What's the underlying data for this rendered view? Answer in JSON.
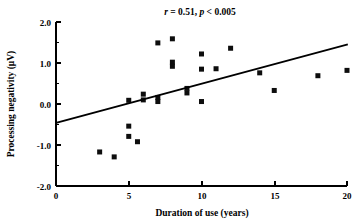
{
  "figure": {
    "title": "r = 0.51, p < 0.005",
    "title_parts": {
      "r_symbol": "r",
      "r_rest": " = 0.51, ",
      "p_symbol": "p",
      "p_rest": " < 0.005"
    },
    "background_color": "#ffffff",
    "ink_color": "#000000"
  },
  "chart_data": {
    "type": "scatter",
    "title": "r = 0.51, p < 0.005",
    "xlabel": "Duration of use (years)",
    "ylabel": "Processing negativity (μV)",
    "xlim": [
      0,
      20
    ],
    "ylim": [
      -2.0,
      2.0
    ],
    "xticks": [
      0,
      5,
      10,
      15,
      20
    ],
    "xtick_labels": [
      "0",
      "5",
      "10",
      "15",
      "20"
    ],
    "yticks": [
      -2.0,
      -1.0,
      0.0,
      1.0,
      2.0
    ],
    "ytick_labels": [
      "-2.0",
      "-1.0",
      "0.0",
      "1.0",
      "2.0"
    ],
    "yminorticks": [
      -1.5,
      -0.5,
      0.5,
      1.5
    ],
    "grid": false,
    "legend": null,
    "marker": "square",
    "marker_color": "#0d0d0d",
    "marker_size": 5,
    "points": [
      {
        "x": 3.0,
        "y": -1.17
      },
      {
        "x": 4.0,
        "y": -1.29
      },
      {
        "x": 5.0,
        "y": -0.54
      },
      {
        "x": 5.0,
        "y": -0.79
      },
      {
        "x": 5.0,
        "y": 0.09
      },
      {
        "x": 5.6,
        "y": -0.92
      },
      {
        "x": 6.0,
        "y": 0.1
      },
      {
        "x": 6.0,
        "y": 0.24
      },
      {
        "x": 7.0,
        "y": 1.49
      },
      {
        "x": 7.0,
        "y": 0.06
      },
      {
        "x": 7.0,
        "y": 0.16
      },
      {
        "x": 8.0,
        "y": 1.59
      },
      {
        "x": 8.0,
        "y": 1.02
      },
      {
        "x": 8.0,
        "y": 0.92
      },
      {
        "x": 9.0,
        "y": 0.27
      },
      {
        "x": 9.0,
        "y": 0.38
      },
      {
        "x": 10.0,
        "y": 1.22
      },
      {
        "x": 10.0,
        "y": 0.85
      },
      {
        "x": 10.0,
        "y": 0.06
      },
      {
        "x": 11.0,
        "y": 0.86
      },
      {
        "x": 12.0,
        "y": 1.36
      },
      {
        "x": 14.0,
        "y": 0.76
      },
      {
        "x": 15.0,
        "y": 0.33
      },
      {
        "x": 18.0,
        "y": 0.69
      },
      {
        "x": 20.0,
        "y": 0.82
      }
    ],
    "trend_line": {
      "x_start": 0,
      "y_start": -0.46,
      "x_end": 20,
      "y_end": 1.45,
      "slope": 0.0955,
      "intercept": -0.46
    },
    "statistics": {
      "r": 0.51,
      "p": "< 0.005"
    }
  }
}
